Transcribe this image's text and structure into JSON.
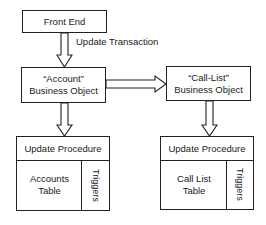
{
  "diagram": {
    "nodes": {
      "front_end": {
        "label": "Front End"
      },
      "account_bo": {
        "line1": "“Account”",
        "line2": "Business Object"
      },
      "calllist_bo": {
        "line1": "“Call-List”",
        "line2": "Business Object"
      },
      "account_db": {
        "procedure": "Update Procedure",
        "table_line1": "Accounts",
        "table_line2": "Table",
        "triggers": "Triggers"
      },
      "calllist_db": {
        "procedure": "Update Procedure",
        "table_line1": "Call List",
        "table_line2": "Table",
        "triggers": "Triggers"
      }
    },
    "edges": [
      {
        "from": "front_end",
        "to": "account_bo",
        "label": "Update Transaction"
      },
      {
        "from": "account_bo",
        "to": "calllist_bo",
        "label": ""
      },
      {
        "from": "account_bo",
        "to": "account_db",
        "label": ""
      },
      {
        "from": "calllist_bo",
        "to": "calllist_db",
        "label": ""
      }
    ],
    "edge_label": "Update Transaction"
  }
}
